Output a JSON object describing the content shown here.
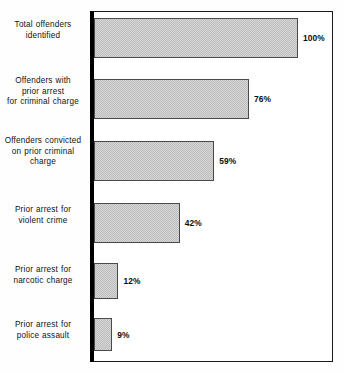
{
  "chart_data": {
    "type": "bar",
    "orientation": "horizontal",
    "title": "",
    "subtitle": "",
    "xlabel": "",
    "ylabel": "",
    "xlim": [
      0,
      100
    ],
    "grid": false,
    "legend": null,
    "value_suffix": "%",
    "categories": [
      "Total offenders identified",
      "Offenders with prior arrest for criminal charge",
      "Offenders convicted on prior criminal charge",
      "Prior arrest for violent crime",
      "Prior arrest for narcotic charge",
      "Prior arrest for police assault"
    ],
    "values": [
      100,
      76,
      59,
      42,
      12,
      9
    ],
    "value_labels": [
      "100%",
      "76%",
      "59%",
      "42%",
      "12%",
      "9%"
    ],
    "bars": [
      {
        "label_lines": [
          "Total offenders",
          "identified"
        ],
        "value": 100,
        "value_label": "100%"
      },
      {
        "label_lines": [
          "Offenders with",
          "prior arrest",
          "for criminal charge"
        ],
        "value": 76,
        "value_label": "76%"
      },
      {
        "label_lines": [
          "Offenders convicted",
          "on prior criminal",
          "charge"
        ],
        "value": 59,
        "value_label": "59%"
      },
      {
        "label_lines": [
          "Prior arrest for",
          "violent crime"
        ],
        "value": 42,
        "value_label": "42%"
      },
      {
        "label_lines": [
          "Prior arrest for",
          "narcotic charge"
        ],
        "value": 12,
        "value_label": "12%"
      },
      {
        "label_lines": [
          "Prior arrest for",
          "police assault"
        ],
        "value": 9,
        "value_label": "9%"
      }
    ],
    "colors": {
      "bar_fill": "#d6d6d6",
      "bar_pattern": "#bdbdbd",
      "bar_border": "#4a4a4a",
      "axis": "#000000",
      "frame": "#1a1a1a",
      "text": "#111111",
      "background": "#fefefe"
    }
  },
  "layout": {
    "bar_tops": [
      18,
      79,
      141,
      203,
      263,
      318
    ],
    "bar_heights": [
      40,
      40,
      40,
      40,
      36,
      33
    ],
    "label_tops": [
      20,
      76,
      136,
      205,
      265,
      320
    ],
    "plot_left": 94,
    "plot_right": 332,
    "scale_px_per_unit": 2.04
  }
}
